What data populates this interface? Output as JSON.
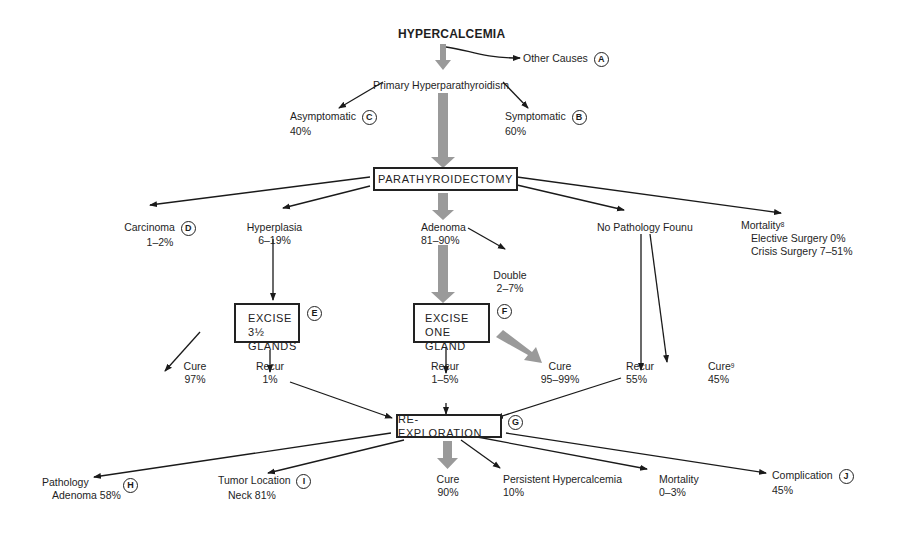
{
  "title": "HYPERCALCEMIA",
  "nodes": {
    "other_causes": {
      "label": "Other Causes",
      "marker": "A"
    },
    "primary": {
      "label": "Primary Hyperparathyroidism"
    },
    "asymptomatic": {
      "label": "Asymptomatic",
      "value": "40%",
      "marker": "C"
    },
    "symptomatic": {
      "label": "Symptomatic",
      "value": "60%",
      "marker": "B"
    },
    "parathyroidectomy": {
      "label": "PARATHYROIDECTOMY"
    },
    "carcinoma": {
      "label": "Carcinoma",
      "value": "1–2%",
      "marker": "D"
    },
    "hyperplasia": {
      "label": "Hyperplasia",
      "value": "6–19%"
    },
    "adenoma": {
      "label": "Adenoma",
      "value": "81–90%"
    },
    "double": {
      "label": "Double",
      "value": "2–7%"
    },
    "no_pathology": {
      "label": "No Pathology Founu"
    },
    "mortality_top": {
      "label": "Mortality",
      "sup": "8",
      "line1": "Elective Surgery 0%",
      "line2": "Crisis Surgery 7–51%"
    },
    "excise_35": {
      "line1": "EXCISE 3½",
      "line2": "GLANDS",
      "marker": "E"
    },
    "excise_one": {
      "line1": "EXCISE ONE",
      "line2": "GLAND",
      "marker": "F"
    },
    "cure_97": {
      "label": "Cure",
      "value": "97%"
    },
    "recur_1": {
      "label": "Recur",
      "value": "1%"
    },
    "recur_15": {
      "label": "Recur",
      "value": "1–5%"
    },
    "cure_9599": {
      "label": "Cure",
      "value": "95–99%"
    },
    "recur_55": {
      "label": "Recur",
      "value": "55%"
    },
    "cure_45": {
      "label": "Cure",
      "sup": "9",
      "value": "45%"
    },
    "reexploration": {
      "label": "RE-EXPLORATION",
      "marker": "G"
    },
    "pathology": {
      "label": "Pathology",
      "value": "Adenoma 58%",
      "marker": "H"
    },
    "tumor_location": {
      "label": "Tumor Location",
      "value": "Neck 81%",
      "marker": "I"
    },
    "cure_90": {
      "label": "Cure",
      "value": "90%"
    },
    "persistent": {
      "label": "Persistent Hypercalcemia",
      "value": "10%"
    },
    "mortality_bottom": {
      "label": "Mortality",
      "value": "0–3%"
    },
    "complication": {
      "label": "Complication",
      "value": "45%",
      "marker": "J"
    }
  },
  "colors": {
    "line": "#1a1a1a",
    "main_path": "#9a9a9a",
    "background": "#ffffff"
  }
}
